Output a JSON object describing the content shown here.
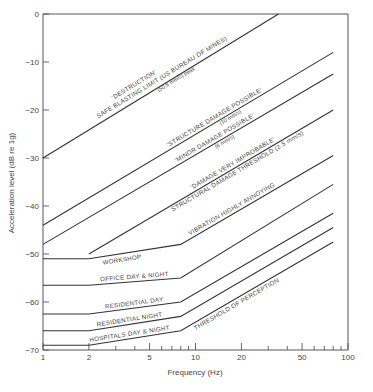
{
  "chart_data": {
    "type": "line",
    "title": "",
    "xlabel": "Frequency (Hz)",
    "ylabel": "Acceleration level (dB re 1g)",
    "xscale": "log",
    "xlim": [
      1,
      100
    ],
    "ylim": [
      -70,
      0
    ],
    "grid": false,
    "legend": "none",
    "x_ticks": [
      1,
      2,
      5,
      10,
      20,
      50,
      100
    ],
    "x_tick_labels": [
      "1",
      "2",
      "5",
      "10",
      "20",
      "50",
      "100"
    ],
    "x_minor_ticks": [
      3,
      4,
      6,
      7,
      8,
      9,
      30,
      40,
      60,
      70,
      80,
      90
    ],
    "y_ticks": [
      0,
      -10,
      -20,
      -30,
      -40,
      -50,
      -60,
      -70
    ],
    "y_tick_labels": [
      "0",
      "−10",
      "−20",
      "−30",
      "−40",
      "−50",
      "−60",
      "−70"
    ],
    "series": [
      {
        "name": "destruction",
        "label": "'DESTRUCTION'",
        "label2": "SAFE BLASTING LIMIT (US BUREAU OF MINES)",
        "sublabel": "(50.8 mm/s) peak",
        "x": [
          1,
          35
        ],
        "y": [
          -30,
          0
        ]
      },
      {
        "name": "structure-damage-possible",
        "label": "'STRUCTURE DAMAGE POSSIBLE'",
        "sublabel": "(10 mm/s)",
        "x": [
          1,
          80
        ],
        "y": [
          -44,
          -8
        ]
      },
      {
        "name": "minor-damage-possible",
        "label": "'MINOR DAMAGE POSSIBLE'",
        "sublabel": "(6 mm/s)",
        "x": [
          1,
          80
        ],
        "y": [
          -48,
          -12.5
        ]
      },
      {
        "name": "damage-very-improbable",
        "label": "'DAMAGE VERY IMPROBABLE'",
        "label2": "STRUCTURAL DAMAGE THRESHOLD (2.5 mm/s)",
        "x": [
          2,
          80
        ],
        "y": [
          -50,
          -20
        ]
      },
      {
        "name": "workshop",
        "label": "WORKSHOP",
        "label2": "VIBRATION HIGHLY ANNOYING",
        "x": [
          1,
          2,
          8,
          80
        ],
        "y": [
          -51,
          -51,
          -48,
          -29.5
        ]
      },
      {
        "name": "office-day-night",
        "label": "OFFICE DAY & NIGHT",
        "x": [
          1,
          2,
          8,
          80
        ],
        "y": [
          -56.5,
          -56.5,
          -55,
          -35.5
        ]
      },
      {
        "name": "residential-day",
        "label": "RESIDENTIAL DAY",
        "x": [
          1,
          2,
          8,
          80
        ],
        "y": [
          -62.5,
          -62.5,
          -60,
          -41.5
        ]
      },
      {
        "name": "residential-night",
        "label": "RESIDENTIAL NIGHT",
        "x": [
          1,
          2,
          8,
          80
        ],
        "y": [
          -66,
          -66,
          -63,
          -44.5
        ]
      },
      {
        "name": "hospitals-day-night",
        "label": "HOSPITALS DAY & NIGHT",
        "label2": "THRESHOLD OF PERCEPTION",
        "x": [
          1,
          2,
          8,
          80
        ],
        "y": [
          -69,
          -69,
          -66,
          -47.5
        ]
      }
    ]
  }
}
